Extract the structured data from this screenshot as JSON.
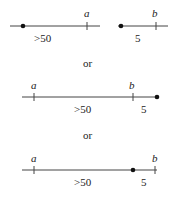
{
  "diagram": {
    "separator_label": "or",
    "rows": [
      {
        "id": "case-1",
        "segments": [
          {
            "start_label": "",
            "end_label": "a",
            "length_label": ">50"
          },
          {
            "start_label": "",
            "end_label": "b",
            "length_label": "5"
          }
        ]
      },
      {
        "id": "case-2",
        "labels": {
          "a": "a",
          "b": "b",
          "long": ">50",
          "short": "5"
        }
      },
      {
        "id": "case-3",
        "labels": {
          "a": "a",
          "b": "b",
          "long": ">50",
          "short": "5"
        }
      }
    ],
    "colors": {
      "line": "#444444",
      "dot": "#111111",
      "text": "#222222"
    }
  }
}
